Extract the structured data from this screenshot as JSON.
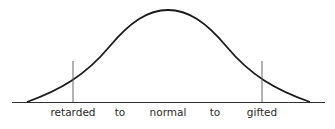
{
  "diagram": {
    "type": "normal-distribution-curve",
    "labels": [
      "retarded",
      "to",
      "normal",
      "to",
      "gifted"
    ],
    "markers": [
      {
        "name": "left-cutoff",
        "x": 73
      },
      {
        "name": "right-cutoff",
        "x": 262
      }
    ],
    "colors": {
      "line": "#1a1a1a",
      "marker": "#555555",
      "text": "#2a2a2a",
      "background": "#ffffff"
    }
  }
}
